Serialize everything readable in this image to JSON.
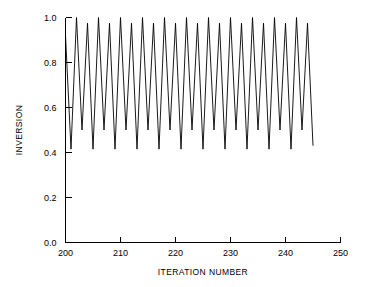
{
  "chart_data": {
    "type": "line",
    "title": "",
    "subtitle": "",
    "xlabel": "ITERATION NUMBER",
    "ylabel": "INVERSION",
    "xlim": [
      200,
      250
    ],
    "ylim": [
      0.0,
      1.0
    ],
    "grid": false,
    "legend": null,
    "xticks": [
      200,
      210,
      220,
      230,
      240,
      250
    ],
    "xtick_labels": [
      "200",
      "210",
      "220",
      "230",
      "240",
      "250"
    ],
    "yticks": [
      0.0,
      0.2,
      0.4,
      0.6,
      0.8,
      1.0
    ],
    "ytick_labels": [
      "0.0",
      "0.2",
      "0.4",
      "0.6",
      "0.8",
      "1.0"
    ],
    "series": [
      {
        "name": "inversion",
        "color": "#000000",
        "x": [
          200,
          201,
          202,
          203,
          204,
          205,
          206,
          207,
          208,
          209,
          210,
          211,
          212,
          213,
          214,
          215,
          216,
          217,
          218,
          219,
          220,
          221,
          222,
          223,
          224,
          225,
          226,
          227,
          228,
          229,
          230,
          231,
          232,
          233,
          234,
          235,
          236,
          237,
          238,
          239,
          240,
          241,
          242,
          243,
          244,
          245
        ],
        "values": [
          0.92,
          0.415,
          1.0,
          0.5,
          0.975,
          0.415,
          1.0,
          0.5,
          0.975,
          0.415,
          1.0,
          0.5,
          0.975,
          0.415,
          1.0,
          0.5,
          0.975,
          0.415,
          1.0,
          0.5,
          0.975,
          0.415,
          1.0,
          0.5,
          0.975,
          0.415,
          1.0,
          0.5,
          0.975,
          0.415,
          1.0,
          0.5,
          0.975,
          0.415,
          1.0,
          0.5,
          0.975,
          0.415,
          1.0,
          0.5,
          0.975,
          0.415,
          1.0,
          0.5,
          0.975,
          0.43
        ]
      }
    ]
  },
  "axes": {
    "x_axis_label": "ITERATION NUMBER",
    "y_axis_label": "INVERSION"
  }
}
